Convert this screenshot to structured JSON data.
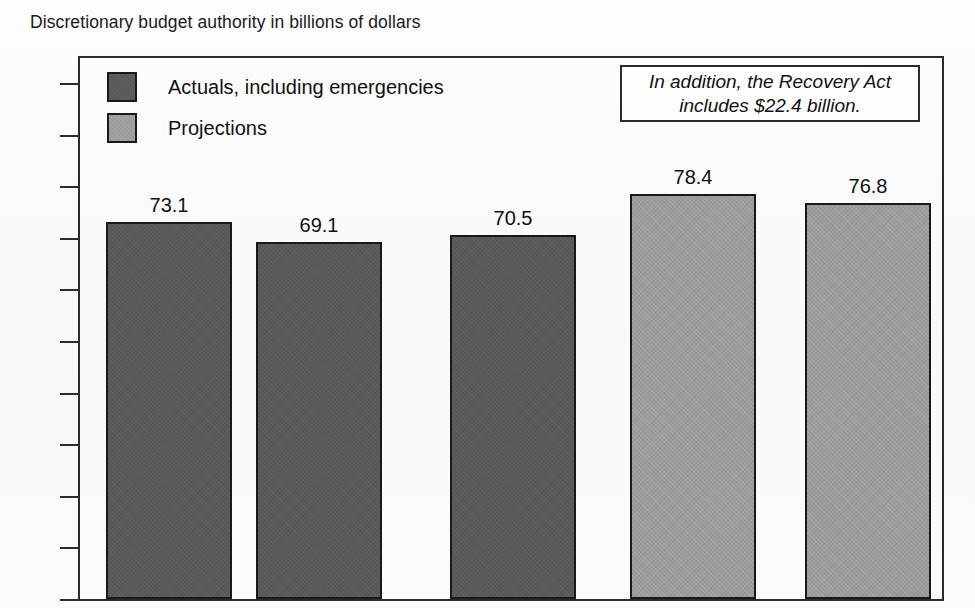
{
  "subtitle": "Discretionary budget authority in billions of dollars",
  "annotation": {
    "line1": "In addition, the Recovery Act",
    "line2": "includes $22.4 billion."
  },
  "legend": {
    "items": [
      {
        "label": "Actuals, including emergencies",
        "swatch": "dark",
        "color": "#595959"
      },
      {
        "label": "Projections",
        "swatch": "light",
        "color": "#9b9b9b"
      }
    ]
  },
  "chart_data": {
    "type": "bar",
    "title": "Discretionary budget authority in billions of dollars",
    "xlabel": "",
    "ylabel": "",
    "ylim": [
      0,
      100
    ],
    "yticks": [
      0,
      10,
      20,
      30,
      40,
      50,
      60,
      70,
      80,
      90,
      100
    ],
    "ytick_labels": [
      "0",
      "10",
      "20",
      "30",
      "40",
      "50",
      "60",
      "70",
      "80",
      "90",
      "100"
    ],
    "grid": false,
    "legend_position": "top-left",
    "categories": [
      "",
      "",
      "",
      "",
      ""
    ],
    "values": [
      73.1,
      69.1,
      70.5,
      78.4,
      76.8
    ],
    "data_labels": [
      "73.1",
      "69.1",
      "70.5",
      "78.4",
      "76.8"
    ],
    "series": [
      {
        "name": "Actuals, including emergencies",
        "color": "#595959",
        "values": [
          73.1,
          69.1,
          70.5,
          null,
          null
        ]
      },
      {
        "name": "Projections",
        "color": "#9b9b9b",
        "values": [
          null,
          null,
          null,
          78.4,
          76.8
        ]
      }
    ],
    "bars": [
      {
        "value": 73.1,
        "label": "73.1",
        "series": "Actuals, including emergencies",
        "style": "dark",
        "x": 106,
        "width": 126
      },
      {
        "value": 69.1,
        "label": "69.1",
        "series": "Actuals, including emergencies",
        "style": "dark",
        "x": 256,
        "width": 126
      },
      {
        "value": 70.5,
        "label": "70.5",
        "series": "Actuals, including emergencies",
        "style": "dark",
        "x": 450,
        "width": 126
      },
      {
        "value": 78.4,
        "label": "78.4",
        "series": "Projections",
        "style": "light",
        "x": 630,
        "width": 126
      },
      {
        "value": 76.8,
        "label": "76.8",
        "series": "Projections",
        "style": "light",
        "x": 805,
        "width": 126
      }
    ],
    "annotation": "In addition, the Recovery Act includes $22.4 billion."
  }
}
